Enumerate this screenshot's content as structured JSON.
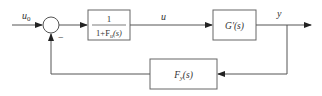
{
  "diagram": {
    "type": "block-diagram-feedback-loop",
    "signals": {
      "input": {
        "label": "u",
        "subscript": "0"
      },
      "control": {
        "label": "u"
      },
      "output": {
        "label": "y"
      }
    },
    "summing_junction": {
      "feedback_sign": "−"
    },
    "blocks": {
      "prefilter": {
        "numerator": "1",
        "denominator_prefix": "1+F",
        "denominator_subscript": "u",
        "denominator_suffix": "(s)"
      },
      "plant": {
        "label_main": "G'",
        "label_arg": "(s)"
      },
      "feedback": {
        "label_main": "F",
        "label_subscript": "y",
        "label_arg": "(s)"
      }
    },
    "colors": {
      "line": "#555555",
      "box": "#666666",
      "text": "#333333"
    }
  }
}
